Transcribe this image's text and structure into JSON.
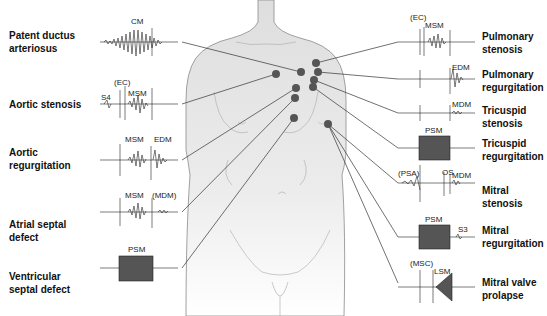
{
  "left_conditions": [
    {
      "id": "pda",
      "label_line1": "Patent ductus",
      "label_line2": "arteriosus",
      "waveform_labels": [
        "CM"
      ]
    },
    {
      "id": "as",
      "label_line1": "Aortic stenosis",
      "label_line2": "",
      "waveform_labels": [
        "S4",
        "(EC)",
        "MSM"
      ]
    },
    {
      "id": "ar",
      "label_line1": "Aortic",
      "label_line2": "regurgitation",
      "waveform_labels": [
        "MSM",
        "EDM"
      ]
    },
    {
      "id": "asd",
      "label_line1": "Atrial septal",
      "label_line2": "defect",
      "waveform_labels": [
        "MSM",
        "(MDM)"
      ]
    },
    {
      "id": "vsd",
      "label_line1": "Ventricular",
      "label_line2": "septal defect",
      "waveform_labels": [
        "PSM"
      ]
    }
  ],
  "right_conditions": [
    {
      "id": "ps",
      "label_line1": "Pulmonary",
      "label_line2": "stenosis",
      "waveform_labels": [
        "(EC)",
        "MSM"
      ]
    },
    {
      "id": "pr",
      "label_line1": "Pulmonary",
      "label_line2": "regurgitation",
      "waveform_labels": [
        "EDM"
      ]
    },
    {
      "id": "ts",
      "label_line1": "Tricuspid",
      "label_line2": "stenosis",
      "waveform_labels": [
        "MDM"
      ]
    },
    {
      "id": "tr",
      "label_line1": "Tricuspid",
      "label_line2": "regurgitation",
      "waveform_labels": [
        "PSM"
      ]
    },
    {
      "id": "ms",
      "label_line1": "Mitral stenosis",
      "label_line2": "",
      "waveform_labels": [
        "(PSA)",
        "OS",
        "MDM"
      ]
    },
    {
      "id": "mr",
      "label_line1": "Mitral",
      "label_line2": "regurgitation",
      "waveform_labels": [
        "PSM",
        "S3"
      ]
    },
    {
      "id": "mvp",
      "label_line1": "Mitral valve",
      "label_line2": "prolapse",
      "waveform_labels": [
        "(MSC)",
        "LSM"
      ]
    }
  ],
  "colors": {
    "line": "#333333",
    "dot": "#555555",
    "torso_fill": "#e6e6e6",
    "outline": "#8a8a8a",
    "text": "#111111"
  }
}
